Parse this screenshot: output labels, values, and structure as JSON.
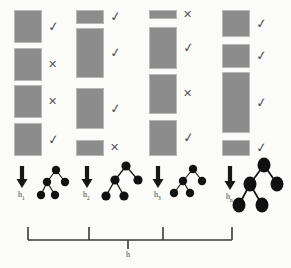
{
  "figure": {
    "background_color": "#fbfbfa",
    "box_fill_color": "#8c8c8c",
    "box_stroke_color": "#b9b9b9",
    "node_color": "#111111",
    "mark_color": "#555555",
    "bracket_color": "#3a3a3a"
  },
  "columns": [
    {
      "id": "column-1",
      "hypothesis_label": "h",
      "hypothesis_subscript": "1",
      "x": 14,
      "width": 28,
      "segments": [
        {
          "y": 10,
          "height": 33,
          "mark": "check",
          "mark_glyph": "✓"
        },
        {
          "y": 48,
          "height": 33,
          "mark": "cross",
          "mark_glyph": "✕"
        },
        {
          "y": 85,
          "height": 33,
          "mark": "cross",
          "mark_glyph": "✕"
        },
        {
          "y": 123,
          "height": 33,
          "mark": "check",
          "mark_glyph": "✓"
        }
      ],
      "arrow": {
        "x": 22,
        "y_top": 166,
        "y_bottom": 188
      },
      "tree": {
        "scale": 1.0,
        "node_rx": 4.2,
        "node_ry": 4.2,
        "nodes": [
          {
            "id": "root",
            "x": 56,
            "y": 170
          },
          {
            "id": "left",
            "x": 47,
            "y": 182
          },
          {
            "id": "right",
            "x": 65,
            "y": 182
          },
          {
            "id": "left-left",
            "x": 41,
            "y": 195
          },
          {
            "id": "left-right",
            "x": 55,
            "y": 195
          }
        ],
        "edges": [
          [
            "root",
            "left"
          ],
          [
            "root",
            "right"
          ],
          [
            "left",
            "left-left"
          ],
          [
            "left",
            "left-right"
          ]
        ]
      }
    },
    {
      "id": "column-2",
      "hypothesis_label": "h",
      "hypothesis_subscript": "2",
      "x": 76,
      "width": 28,
      "segments": [
        {
          "y": 10,
          "height": 14,
          "mark": "check",
          "mark_glyph": "✓"
        },
        {
          "y": 28,
          "height": 50,
          "mark": "check",
          "mark_glyph": "✓"
        },
        {
          "y": 88,
          "height": 41,
          "mark": "check",
          "mark_glyph": "✓"
        },
        {
          "y": 140,
          "height": 16,
          "mark": "cross",
          "mark_glyph": "✕"
        }
      ],
      "arrow": {
        "x": 87,
        "y_top": 166,
        "y_bottom": 188
      },
      "tree": {
        "scale": 1.15,
        "node_rx": 4.6,
        "node_ry": 4.6,
        "nodes": [
          {
            "id": "root",
            "x": 126,
            "y": 166
          },
          {
            "id": "left",
            "x": 115,
            "y": 180
          },
          {
            "id": "right",
            "x": 138,
            "y": 180
          },
          {
            "id": "left-left",
            "x": 106,
            "y": 196
          },
          {
            "id": "left-right",
            "x": 124,
            "y": 196
          }
        ],
        "edges": [
          [
            "root",
            "left"
          ],
          [
            "root",
            "right"
          ],
          [
            "left",
            "left-left"
          ],
          [
            "left",
            "left-right"
          ]
        ]
      }
    },
    {
      "id": "column-3",
      "hypothesis_label": "h",
      "hypothesis_subscript": "3",
      "x": 149,
      "width": 28,
      "segments": [
        {
          "y": 10,
          "height": 9,
          "mark": "cross",
          "mark_glyph": "✕"
        },
        {
          "y": 27,
          "height": 42,
          "mark": "check",
          "mark_glyph": "✓"
        },
        {
          "y": 74,
          "height": 40,
          "mark": "cross",
          "mark_glyph": "✕"
        },
        {
          "y": 120,
          "height": 36,
          "mark": "check",
          "mark_glyph": "✓"
        }
      ],
      "arrow": {
        "x": 158,
        "y_top": 166,
        "y_bottom": 188
      },
      "tree": {
        "scale": 1.0,
        "node_rx": 4.2,
        "node_ry": 4.2,
        "nodes": [
          {
            "id": "root",
            "x": 193,
            "y": 169
          },
          {
            "id": "left",
            "x": 183,
            "y": 181
          },
          {
            "id": "right",
            "x": 202,
            "y": 181
          },
          {
            "id": "left-left",
            "x": 174,
            "y": 193
          },
          {
            "id": "left-right",
            "x": 190,
            "y": 193
          }
        ],
        "edges": [
          [
            "root",
            "left"
          ],
          [
            "root",
            "right"
          ],
          [
            "left",
            "left-left"
          ],
          [
            "left",
            "left-right"
          ]
        ]
      }
    },
    {
      "id": "column-4",
      "hypothesis_label": "h",
      "hypothesis_subscript": "n",
      "x": 222,
      "width": 28,
      "segments": [
        {
          "y": 10,
          "height": 27,
          "mark": "check",
          "mark_glyph": "✓"
        },
        {
          "y": 44,
          "height": 24,
          "mark": "check",
          "mark_glyph": "✓"
        },
        {
          "y": 72,
          "height": 61,
          "mark": "check",
          "mark_glyph": "✓"
        },
        {
          "y": 140,
          "height": 16,
          "mark": "check",
          "mark_glyph": "✓"
        }
      ],
      "arrow": {
        "x": 230,
        "y_top": 166,
        "y_bottom": 190
      },
      "tree": {
        "scale": 1.5,
        "node_rx": 6.5,
        "node_ry": 7.5,
        "nodes": [
          {
            "id": "root",
            "x": 264,
            "y": 165
          },
          {
            "id": "left",
            "x": 250,
            "y": 184
          },
          {
            "id": "right",
            "x": 277,
            "y": 184
          },
          {
            "id": "left-left",
            "x": 239,
            "y": 205
          },
          {
            "id": "left-right",
            "x": 262,
            "y": 205
          }
        ],
        "edges": [
          [
            "root",
            "left"
          ],
          [
            "root",
            "right"
          ],
          [
            "left",
            "left-left"
          ],
          [
            "left",
            "left-right"
          ]
        ]
      }
    }
  ],
  "bracket": {
    "label": "h",
    "x_start": 28,
    "x_end": 232,
    "y_line": 240,
    "cap_height": 13,
    "ticks_up": [
      89,
      163
    ],
    "tick_down_x": 128,
    "tick_down_height": 9,
    "label_x": 126,
    "label_y": 250
  }
}
